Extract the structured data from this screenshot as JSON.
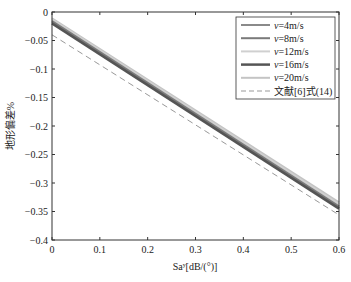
{
  "chart_data": {
    "type": "line",
    "title": "",
    "xlabel": "Saʸ[dB/(°)]",
    "ylabel": "地形偏差%",
    "xlim": [
      0,
      0.6
    ],
    "ylim": [
      -0.4,
      0
    ],
    "x_ticks": [
      "0",
      "0.1",
      "0.2",
      "0.3",
      "0.4",
      "0.5",
      "0.6"
    ],
    "y_ticks": [
      "0",
      "-0.05",
      "-0.1",
      "-0.15",
      "-0.2",
      "-0.25",
      "-0.3",
      "-0.35",
      "-0.4"
    ],
    "grid": false,
    "legend_position": "upper right",
    "x": [
      0,
      0.6
    ],
    "series": [
      {
        "name": "v=4m/s",
        "values": [
          -0.018,
          -0.343
        ],
        "color": "#8a8a8a",
        "style": "solid",
        "width": 2
      },
      {
        "name": "v=8m/s",
        "values": [
          -0.016,
          -0.341
        ],
        "color": "#7a7a7a",
        "style": "solid",
        "width": 2
      },
      {
        "name": "v=12m/s",
        "values": [
          -0.013,
          -0.337
        ],
        "color": "#d0d0d0",
        "style": "solid",
        "width": 2
      },
      {
        "name": "v=16m/s",
        "values": [
          -0.02,
          -0.345
        ],
        "color": "#555555",
        "style": "solid",
        "width": 2.5
      },
      {
        "name": "v=20m/s",
        "values": [
          -0.011,
          -0.334
        ],
        "color": "#c4c4c4",
        "style": "solid",
        "width": 2
      },
      {
        "name": "文献[6]式(14)",
        "values": [
          -0.04,
          -0.356
        ],
        "color": "#999999",
        "style": "dashed",
        "width": 1
      }
    ]
  },
  "legend": {
    "items": [
      {
        "label": "v=4m/s"
      },
      {
        "label": "v=8m/s"
      },
      {
        "label": "v=12m/s"
      },
      {
        "label": "v=16m/s"
      },
      {
        "label": "v=20m/s"
      },
      {
        "label": "文献[6]式(14)"
      }
    ]
  }
}
